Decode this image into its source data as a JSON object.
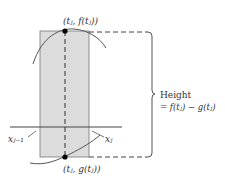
{
  "diagram": {
    "top_point_label": "(tⱼ, f(tⱼ))",
    "bottom_point_label": "(tⱼ, g(tⱼ))",
    "left_tick_label": "xⱼ₋₁",
    "right_tick_label": "xⱼ",
    "height_label": "Height",
    "height_formula": "= f(tⱼ) − g(tⱼ)",
    "colors": {
      "rect_fill": "#dcdcdc",
      "stroke": "#555555",
      "point": "#000000"
    }
  }
}
